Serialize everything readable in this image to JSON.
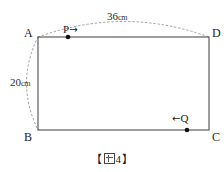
{
  "figure": {
    "caption_open_bracket": "【",
    "caption_close_bracket": "】",
    "caption_number": "4",
    "caption_full": "【図 4】",
    "shape": "rectangle",
    "colors": {
      "stroke": "#555555",
      "dotted": "#9a9a9a",
      "text": "#1c1c1c",
      "background": "#ffffff"
    }
  },
  "vertices": {
    "top_left": "A",
    "top_right": "D",
    "bottom_left": "B",
    "bottom_right": "C"
  },
  "dimensions": {
    "top": {
      "value": "36",
      "unit": "cm",
      "full": "36cm"
    },
    "left": {
      "value": "20",
      "unit": "cm",
      "full": "20cm"
    }
  },
  "moving_points": {
    "p": {
      "label": "P",
      "arrow": "→",
      "direction": "right",
      "edge": "top"
    },
    "q": {
      "label": "Q",
      "arrow": "←",
      "direction": "left",
      "edge": "bottom"
    }
  },
  "geometry": {
    "rect": {
      "x": 38,
      "y": 37,
      "width": 171,
      "height": 93
    },
    "point_p_x": 68,
    "point_q_x": 187
  }
}
